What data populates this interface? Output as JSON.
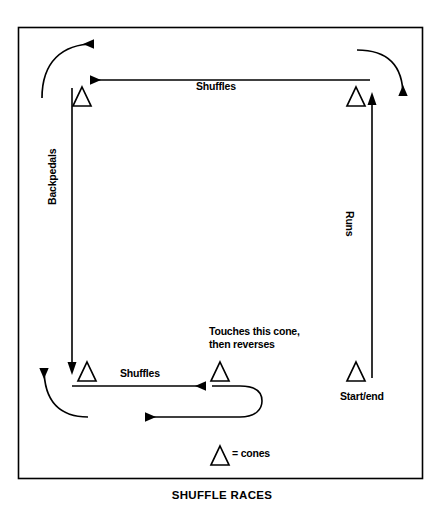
{
  "figure": {
    "title": "SHUFFLE RACES",
    "border_color": "#000000",
    "line_color": "#000000",
    "background": "#ffffff"
  },
  "labels": {
    "shuffles_top": "Shuffles",
    "shuffles_bottom": "Shuffles",
    "backpedals": "Backpedals",
    "runs": "Runs",
    "touches_line1": "Touches this cone,",
    "touches_line2": "then reverses",
    "start_end": "Start/end",
    "legend": "= cones"
  },
  "diagram_data": {
    "type": "diagram",
    "description": "Agility drill court diagram showing a rectangular path between four cones with movement direction arrows",
    "cones": [
      {
        "name": "cone-top-left",
        "x": 82,
        "y": 97
      },
      {
        "name": "cone-top-right",
        "x": 356,
        "y": 97
      },
      {
        "name": "cone-bottom-left",
        "x": 82,
        "y": 372
      },
      {
        "name": "cone-bottom-middle",
        "x": 220,
        "y": 372
      },
      {
        "name": "cone-bottom-right",
        "x": 356,
        "y": 372
      },
      {
        "name": "cone-legend",
        "x": 220,
        "y": 456
      }
    ],
    "segments": [
      {
        "name": "shuffles-top",
        "from": "cone-top-right",
        "to": "cone-top-left",
        "direction": "left",
        "movement": "Shuffles"
      },
      {
        "name": "backpedals-left",
        "from": "cone-top-left",
        "to": "cone-bottom-left",
        "direction": "down",
        "movement": "Backpedals"
      },
      {
        "name": "shuffles-bottom",
        "from": "cone-bottom-left",
        "to": "cone-bottom-middle",
        "direction": "right",
        "movement": "Shuffles"
      },
      {
        "name": "reverse-u-turn",
        "from": "cone-bottom-middle",
        "to": "return-lane",
        "direction": "u-turn-left",
        "movement": "Touches this cone, then reverses"
      },
      {
        "name": "runs-right",
        "from": "cone-bottom-right",
        "to": "cone-top-right",
        "direction": "up",
        "movement": "Runs"
      }
    ],
    "curve_arrows": [
      {
        "name": "curve-top-left",
        "direction": "right"
      },
      {
        "name": "curve-top-right",
        "direction": "down"
      },
      {
        "name": "curve-bottom-left",
        "direction": "up"
      }
    ]
  }
}
